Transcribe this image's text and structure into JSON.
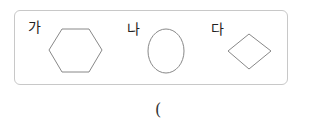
{
  "figure": {
    "items": [
      {
        "label": "가",
        "shape": "hexagon"
      },
      {
        "label": "나",
        "shape": "ellipse"
      },
      {
        "label": "다",
        "shape": "diamond"
      }
    ],
    "stroke_color": "#888888",
    "border_color": "#c8c8c8"
  },
  "answer": {
    "open_paren": "("
  }
}
